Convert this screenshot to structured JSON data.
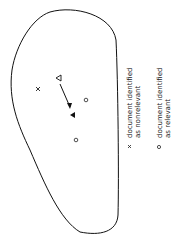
{
  "diagram": {
    "region": "document-space-boundary",
    "points": [
      {
        "type": "query-original",
        "symbol": "hollow-triangle"
      },
      {
        "type": "query-modified",
        "symbol": "filled-triangle"
      },
      {
        "type": "nonrelevant",
        "symbol": "x"
      },
      {
        "type": "relevant",
        "symbol": "o"
      },
      {
        "type": "relevant",
        "symbol": "o"
      }
    ],
    "arrow": "query-movement"
  },
  "legend": {
    "items": [
      {
        "symbol": "x",
        "line1": "document identified",
        "line2": "as nonrelevant"
      },
      {
        "symbol": "o",
        "line1": "document identified",
        "line2": "as relevant"
      }
    ]
  }
}
